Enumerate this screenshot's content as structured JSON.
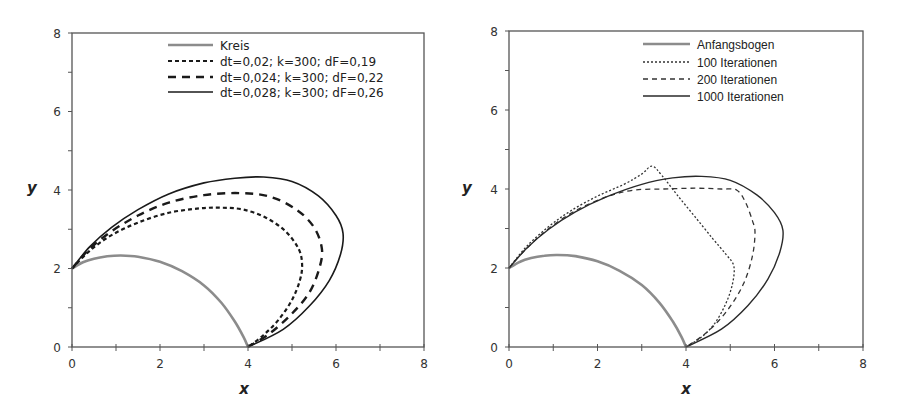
{
  "chart_data": [
    {
      "type": "line",
      "title": "",
      "xlabel": "x",
      "ylabel": "y",
      "xlim": [
        0,
        8
      ],
      "ylim": [
        0,
        8
      ],
      "xticks": [
        "0",
        "2",
        "4",
        "6",
        "8"
      ],
      "yticks": [
        "0",
        "2",
        "4",
        "6",
        "8"
      ],
      "grid": false,
      "legend_position": "upper center",
      "frame": {
        "left": 72,
        "right": 424,
        "top": 33,
        "bottom": 347
      },
      "legend": {
        "line_x1": 168,
        "line_x2": 213,
        "text_x": 220,
        "rows_y": [
          45,
          61,
          77,
          92
        ]
      },
      "series": [
        {
          "name": "Kreis",
          "style": "solid",
          "color": "#8c8c8c",
          "width": 2.6,
          "points": [
            [
              0,
              2
            ],
            [
              0.25,
              2.16
            ],
            [
              0.5,
              2.25
            ],
            [
              0.8,
              2.31
            ],
            [
              1.1,
              2.33
            ],
            [
              1.5,
              2.3
            ],
            [
              2.0,
              2.17
            ],
            [
              2.5,
              1.93
            ],
            [
              3.0,
              1.57
            ],
            [
              3.4,
              1.12
            ],
            [
              3.7,
              0.65
            ],
            [
              3.9,
              0.25
            ],
            [
              4,
              0
            ]
          ]
        },
        {
          "name": "dt=0,02; k=300; dF=0,19",
          "style": "dashed-short",
          "color": "#1a1a1a",
          "width": 2.2,
          "points": [
            [
              0,
              2
            ],
            [
              0.4,
              2.45
            ],
            [
              0.9,
              2.85
            ],
            [
              1.5,
              3.17
            ],
            [
              2.2,
              3.42
            ],
            [
              2.9,
              3.53
            ],
            [
              3.4,
              3.55
            ],
            [
              3.9,
              3.5
            ],
            [
              4.4,
              3.3
            ],
            [
              4.85,
              2.95
            ],
            [
              5.15,
              2.5
            ],
            [
              5.23,
              2.1
            ],
            [
              5.18,
              1.7
            ],
            [
              5.0,
              1.2
            ],
            [
              4.7,
              0.7
            ],
            [
              4.35,
              0.3
            ],
            [
              4,
              0
            ]
          ]
        },
        {
          "name": "dt=0,024; k=300; dF=0,22",
          "style": "dashed-long",
          "color": "#1a1a1a",
          "width": 2.4,
          "points": [
            [
              0,
              2
            ],
            [
              0.4,
              2.5
            ],
            [
              0.9,
              2.95
            ],
            [
              1.5,
              3.35
            ],
            [
              2.2,
              3.68
            ],
            [
              3.0,
              3.87
            ],
            [
              3.8,
              3.92
            ],
            [
              4.5,
              3.83
            ],
            [
              5.1,
              3.5
            ],
            [
              5.5,
              3.05
            ],
            [
              5.68,
              2.5
            ],
            [
              5.62,
              2.0
            ],
            [
              5.4,
              1.4
            ],
            [
              5.0,
              0.85
            ],
            [
              4.5,
              0.35
            ],
            [
              4,
              0
            ]
          ]
        },
        {
          "name": "dt=0,028; k=300; dF=0,26",
          "style": "solid",
          "color": "#1a1a1a",
          "width": 1.6,
          "points": [
            [
              0,
              2
            ],
            [
              0.4,
              2.55
            ],
            [
              0.9,
              3.05
            ],
            [
              1.5,
              3.5
            ],
            [
              2.2,
              3.9
            ],
            [
              3.0,
              4.18
            ],
            [
              3.7,
              4.3
            ],
            [
              4.35,
              4.33
            ],
            [
              5.0,
              4.22
            ],
            [
              5.6,
              3.85
            ],
            [
              6.0,
              3.35
            ],
            [
              6.16,
              2.9
            ],
            [
              6.1,
              2.35
            ],
            [
              5.85,
              1.7
            ],
            [
              5.4,
              1.05
            ],
            [
              4.8,
              0.45
            ],
            [
              4,
              0
            ]
          ]
        }
      ]
    },
    {
      "type": "line",
      "title": "",
      "xlabel": "x",
      "ylabel": "y",
      "xlim": [
        0,
        8
      ],
      "ylim": [
        0,
        8
      ],
      "xticks": [
        "0",
        "2",
        "4",
        "6",
        "8"
      ],
      "yticks": [
        "0",
        "2",
        "4",
        "6",
        "8"
      ],
      "grid": false,
      "legend_position": "upper center",
      "frame": {
        "left": 509,
        "right": 863,
        "top": 31,
        "bottom": 347
      },
      "legend": {
        "line_x1": 643,
        "line_x2": 690,
        "text_x": 697,
        "rows_y": [
          44,
          62,
          79,
          96
        ]
      },
      "series": [
        {
          "name": "Anfangsbogen",
          "style": "solid",
          "color": "#8c8c8c",
          "width": 2.6,
          "points": [
            [
              0,
              2
            ],
            [
              0.25,
              2.16
            ],
            [
              0.5,
              2.25
            ],
            [
              0.8,
              2.31
            ],
            [
              1.1,
              2.33
            ],
            [
              1.5,
              2.3
            ],
            [
              2.0,
              2.17
            ],
            [
              2.5,
              1.93
            ],
            [
              3.0,
              1.57
            ],
            [
              3.4,
              1.12
            ],
            [
              3.7,
              0.65
            ],
            [
              3.9,
              0.25
            ],
            [
              4,
              0
            ]
          ]
        },
        {
          "name": "100 Iterationen",
          "style": "dotted",
          "color": "#333333",
          "width": 1.3,
          "points": [
            [
              0,
              2
            ],
            [
              0.4,
              2.55
            ],
            [
              0.9,
              3.05
            ],
            [
              1.4,
              3.45
            ],
            [
              2.0,
              3.82
            ],
            [
              2.6,
              4.12
            ],
            [
              3.0,
              4.38
            ],
            [
              3.23,
              4.58
            ],
            [
              3.45,
              4.35
            ],
            [
              3.8,
              3.85
            ],
            [
              4.2,
              3.3
            ],
            [
              4.6,
              2.75
            ],
            [
              4.9,
              2.35
            ],
            [
              5.08,
              2.05
            ],
            [
              5.05,
              1.6
            ],
            [
              4.9,
              1.1
            ],
            [
              4.65,
              0.6
            ],
            [
              4.35,
              0.25
            ],
            [
              4,
              0
            ]
          ]
        },
        {
          "name": "200 Iterationen",
          "style": "dashed",
          "color": "#333333",
          "width": 1.3,
          "points": [
            [
              0,
              2
            ],
            [
              0.4,
              2.5
            ],
            [
              0.9,
              3.0
            ],
            [
              1.5,
              3.45
            ],
            [
              2.2,
              3.8
            ],
            [
              2.8,
              3.97
            ],
            [
              3.5,
              4.0
            ],
            [
              4.2,
              4.02
            ],
            [
              4.8,
              4.0
            ],
            [
              5.15,
              3.97
            ],
            [
              5.35,
              3.65
            ],
            [
              5.5,
              3.2
            ],
            [
              5.56,
              2.9
            ],
            [
              5.5,
              2.3
            ],
            [
              5.3,
              1.6
            ],
            [
              4.95,
              0.95
            ],
            [
              4.5,
              0.4
            ],
            [
              4,
              0
            ]
          ]
        },
        {
          "name": "1000 Iterationen",
          "style": "solid",
          "color": "#2a2a2a",
          "width": 1.4,
          "points": [
            [
              0,
              2
            ],
            [
              0.4,
              2.5
            ],
            [
              0.9,
              2.98
            ],
            [
              1.5,
              3.42
            ],
            [
              2.2,
              3.8
            ],
            [
              3.0,
              4.12
            ],
            [
              3.7,
              4.28
            ],
            [
              4.35,
              4.32
            ],
            [
              5.0,
              4.22
            ],
            [
              5.6,
              3.85
            ],
            [
              6.0,
              3.4
            ],
            [
              6.19,
              2.96
            ],
            [
              6.12,
              2.4
            ],
            [
              5.85,
              1.72
            ],
            [
              5.4,
              1.05
            ],
            [
              4.8,
              0.45
            ],
            [
              4,
              0
            ]
          ]
        }
      ]
    }
  ]
}
